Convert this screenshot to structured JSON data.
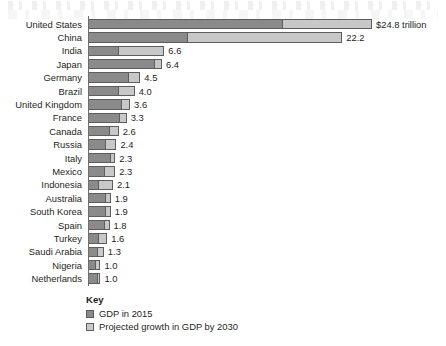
{
  "chart_data": {
    "type": "bar",
    "orientation": "horizontal",
    "stacked": true,
    "title": "",
    "xlabel": "",
    "ylabel": "",
    "unit": "trillion",
    "xlim": [
      0,
      24.8
    ],
    "grid": false,
    "categories": [
      "United States",
      "China",
      "India",
      "Japan",
      "Germany",
      "Brazil",
      "United Kingdom",
      "France",
      "Canada",
      "Russia",
      "Italy",
      "Mexico",
      "Indonesia",
      "Australia",
      "South Korea",
      "Spain",
      "Turkey",
      "Saudi Arabia",
      "Nigeria",
      "Netherlands"
    ],
    "series": [
      {
        "name": "GDP in 2015",
        "color": "#8a8a8a",
        "values": [
          17.0,
          8.7,
          2.6,
          5.8,
          3.5,
          2.6,
          2.9,
          2.7,
          1.8,
          1.5,
          1.9,
          1.4,
          0.9,
          1.5,
          1.5,
          1.4,
          0.9,
          0.8,
          0.6,
          0.8
        ]
      },
      {
        "name": "Projected growth in GDP by 2030",
        "color": "#c8c8c8",
        "values": [
          7.8,
          13.5,
          4.0,
          0.6,
          1.0,
          1.4,
          0.7,
          0.6,
          0.8,
          0.9,
          0.4,
          0.9,
          1.2,
          0.4,
          0.4,
          0.4,
          0.7,
          0.5,
          0.4,
          0.2
        ]
      }
    ],
    "totals": [
      24.8,
      22.2,
      6.6,
      6.4,
      4.5,
      4.0,
      3.6,
      3.3,
      2.6,
      2.4,
      2.3,
      2.3,
      2.1,
      1.9,
      1.9,
      1.8,
      1.6,
      1.3,
      1.0,
      1.0
    ],
    "value_labels": [
      "$24.8 trillion",
      "22.2",
      "6.6",
      "6.4",
      "4.5",
      "4.0",
      "3.6",
      "3.3",
      "2.6",
      "2.4",
      "2.3",
      "2.3",
      "2.1",
      "1.9",
      "1.9",
      "1.8",
      "1.6",
      "1.3",
      "1.0",
      "1.0"
    ],
    "legend_position": "bottom-left"
  },
  "key": {
    "title": "Key",
    "entries": [
      {
        "label": "GDP in 2015",
        "color": "#8a8a8a"
      },
      {
        "label": "Projected growth in GDP by 2030",
        "color": "#c8c8c8"
      }
    ]
  }
}
